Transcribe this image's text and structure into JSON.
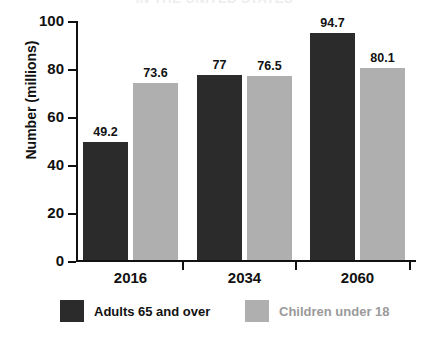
{
  "title": "IN THE UNITED STATES",
  "chart_data": {
    "type": "bar",
    "title": "IN THE UNITED STATES",
    "xlabel": "",
    "ylabel": "Number (millions)",
    "ylim": [
      0,
      100
    ],
    "yticks": [
      "0",
      "20",
      "40",
      "60",
      "80",
      "100"
    ],
    "categories": [
      "2016",
      "2034",
      "2060"
    ],
    "grid": false,
    "legend_position": "bottom",
    "series": [
      {
        "name": "Adults 65 and over",
        "color": "#2b2b2b",
        "values": [
          49.2,
          77,
          94.7
        ],
        "labels": [
          "49.2",
          "77",
          "94.7"
        ]
      },
      {
        "name": "Children under 18",
        "color": "#afafaf",
        "values": [
          73.6,
          76.5,
          80.1
        ],
        "labels": [
          "73.6",
          "76.5",
          "80.1"
        ]
      }
    ]
  },
  "legend": {
    "items": [
      {
        "label": "Adults 65 and over",
        "color": "#2b2b2b",
        "text_color": "#111111"
      },
      {
        "label": "Children under 18",
        "color": "#afafaf",
        "text_color": "#9a9a9a"
      }
    ]
  }
}
